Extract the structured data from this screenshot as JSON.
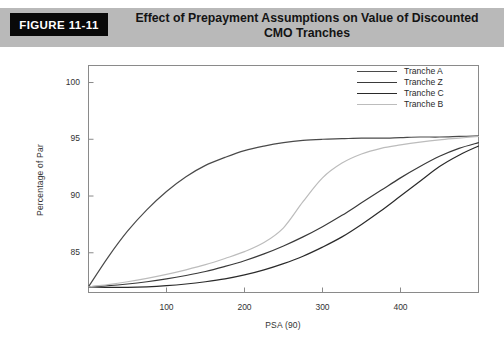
{
  "header": {
    "badge_label": "FIGURE 11-11",
    "title_line1": "Effect of Prepayment Assumptions on Value of Discounted",
    "title_line2": "CMO Tranches",
    "band_color": "#b9b9b9",
    "badge_color": "#090909"
  },
  "chart_data": {
    "type": "line",
    "title": "Effect of Prepayment Assumptions on Value of Discounted CMO Tranches",
    "xlabel": "PSA (90)",
    "ylabel": "Percentage of Par",
    "xlim": [
      0,
      500
    ],
    "ylim": [
      81.5,
      101.5
    ],
    "xticks": [
      100,
      200,
      300,
      400
    ],
    "yticks": [
      85,
      90,
      95,
      100
    ],
    "grid": false,
    "legend_position": "top-right",
    "x": [
      0,
      25,
      50,
      75,
      100,
      125,
      150,
      175,
      200,
      225,
      250,
      275,
      300,
      325,
      350,
      375,
      400,
      425,
      450,
      475,
      500
    ],
    "series": [
      {
        "name": "Tranche A",
        "color": "#4a4a4a",
        "values": [
          82.0,
          84.6,
          86.9,
          88.8,
          90.4,
          91.7,
          92.7,
          93.4,
          94.0,
          94.4,
          94.7,
          94.9,
          95.0,
          95.05,
          95.1,
          95.1,
          95.15,
          95.2,
          95.2,
          95.25,
          95.3
        ]
      },
      {
        "name": "Tranche Z",
        "color": "#3a3a3a",
        "values": [
          82.0,
          82.1,
          82.25,
          82.45,
          82.7,
          83.0,
          83.35,
          83.8,
          84.3,
          84.9,
          85.6,
          86.4,
          87.3,
          88.3,
          89.4,
          90.5,
          91.6,
          92.6,
          93.5,
          94.2,
          94.7
        ]
      },
      {
        "name": "Tranche C",
        "color": "#2a2a2a",
        "values": [
          82.0,
          81.95,
          81.95,
          82.0,
          82.1,
          82.25,
          82.45,
          82.7,
          83.05,
          83.5,
          84.05,
          84.7,
          85.5,
          86.4,
          87.5,
          88.7,
          90.0,
          91.3,
          92.6,
          93.6,
          94.4
        ]
      },
      {
        "name": "Tranche B",
        "color": "#bcbcbc",
        "values": [
          82.0,
          82.2,
          82.45,
          82.75,
          83.1,
          83.5,
          83.95,
          84.5,
          85.1,
          85.9,
          87.2,
          89.5,
          91.6,
          92.9,
          93.7,
          94.2,
          94.5,
          94.75,
          94.95,
          95.1,
          95.25
        ]
      }
    ]
  },
  "axes": {
    "y_tick_labels": [
      "100",
      "95",
      "90",
      "85"
    ],
    "x_tick_labels": [
      "100",
      "200",
      "300",
      "400"
    ]
  },
  "legend": {
    "items": [
      {
        "label": "Tranche A",
        "color": "#4a4a4a"
      },
      {
        "label": "Tranche Z",
        "color": "#3a3a3a"
      },
      {
        "label": "Tranche C",
        "color": "#2a2a2a"
      },
      {
        "label": "Tranche B",
        "color": "#bcbcbc"
      }
    ]
  }
}
